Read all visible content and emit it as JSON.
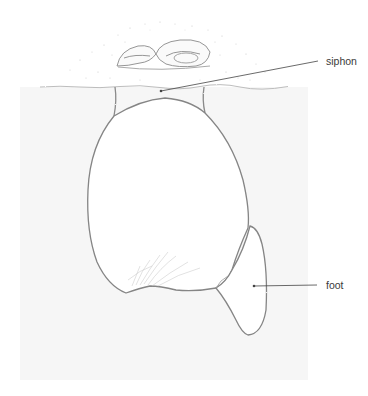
{
  "figure": {
    "colors": {
      "background": "#ffffff",
      "sediment_fill": "#f6f6f6",
      "outline": "#8a8a8a",
      "outline_dark": "#6f6f6f",
      "leader_line": "#444444",
      "label_text": "#3a3a3a"
    },
    "labels": [
      {
        "id": "siphon",
        "text": "siphon"
      },
      {
        "id": "foot",
        "text": "foot"
      }
    ]
  }
}
